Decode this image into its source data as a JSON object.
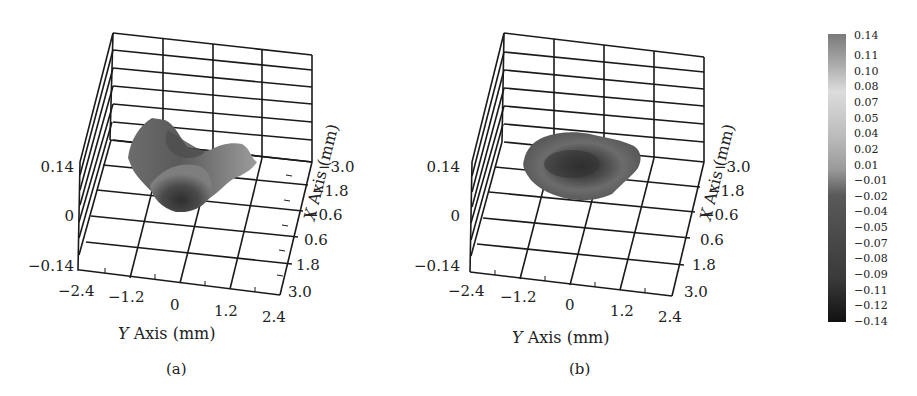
{
  "chart_data": [
    {
      "type": "surface3d",
      "panel_label": "(a)",
      "title": "",
      "xlabel": "Y Axis (mm)",
      "ylabel": "X Axis (mm)",
      "zlabel": "",
      "y_axis_ticks": [
        "-2.4",
        "-1.2",
        "0",
        "1.2",
        "2.4"
      ],
      "x_axis_ticks": [
        "-3.0",
        "-1.8",
        "-0.6",
        "0.6",
        "1.8",
        "3.0"
      ],
      "z_axis_ticks": [
        "0.14",
        "0",
        "-0.14"
      ],
      "ylim": [
        -2.4,
        2.4
      ],
      "xlim": [
        -3.0,
        3.0
      ],
      "zlim": [
        -0.14,
        0.14
      ],
      "grid": true,
      "description": "Irregular, asymmetric surface patch with a dark depressed central region and lighter raised lobes extending to the left and right; gray-scale colormap."
    },
    {
      "type": "surface3d",
      "panel_label": "(b)",
      "title": "",
      "xlabel": "Y Axis (mm)",
      "ylabel": "X Axis (mm)",
      "zlabel": "",
      "y_axis_ticks": [
        "-2.4",
        "-1.2",
        "0",
        "1.2",
        "2.4"
      ],
      "x_axis_ticks": [
        "-3.0",
        "-1.8",
        "-0.6",
        "0.6",
        "1.8",
        "3.0"
      ],
      "z_axis_ticks": [
        "0.14",
        "0",
        "-0.14"
      ],
      "ylim": [
        -2.4,
        2.4
      ],
      "xlim": [
        -3.0,
        3.0
      ],
      "zlim": [
        -0.14,
        0.14
      ],
      "grid": true,
      "description": "Roughly circular, ring-shaped surface patch with a darker central dip surrounded by a medium-gray rim; gray-scale colormap."
    },
    {
      "type": "colorbar",
      "labels": [
        "0.14",
        "0.11",
        "0.10",
        "0.08",
        "0.07",
        "0.05",
        "0.04",
        "0.02",
        "0.01",
        "-0.01",
        "-0.02",
        "-0.04",
        "-0.05",
        "-0.07",
        "-0.08",
        "-0.09",
        "-0.11",
        "-0.12",
        "-0.14"
      ],
      "range": [
        -0.14,
        0.14
      ],
      "colormap": "grayscale"
    }
  ],
  "panels": [
    {
      "caption": "(a)",
      "z_ticks": [
        "0.14",
        "0",
        "−0.14"
      ],
      "y_ticks": [
        "−2.4",
        "−1.2",
        "0",
        "1.2",
        "2.4"
      ],
      "x_ticks": [
        "−3.0",
        "−1.8",
        "−0.6",
        "0.6",
        "1.8",
        "3.0"
      ],
      "y_axis_letter": "Y",
      "y_axis_rest": " Axis (mm)",
      "x_axis_letter": "X",
      "x_axis_rest": " Axis (mm)"
    },
    {
      "caption": "(b)",
      "z_ticks": [
        "0.14",
        "0",
        "−0.14"
      ],
      "y_ticks": [
        "−2.4",
        "−1.2",
        "0",
        "1.2",
        "2.4"
      ],
      "x_ticks": [
        "−3.0",
        "−1.8",
        "−0.6",
        "0.6",
        "1.8",
        "3.0"
      ],
      "y_axis_letter": "Y",
      "y_axis_rest": " Axis (mm)",
      "x_axis_letter": "X",
      "x_axis_rest": " Axis (mm)"
    }
  ],
  "colorbar": {
    "labels": [
      "0.14",
      "0.11",
      "0.10",
      "0.08",
      "0.07",
      "0.05",
      "0.04",
      "0.02",
      "0.01",
      "−0.01",
      "−0.02",
      "−0.04",
      "−0.05",
      "−0.07",
      "−0.08",
      "−0.09",
      "−0.11",
      "−0.12",
      "−0.14"
    ],
    "colors": {
      "top": "#7a7a7a",
      "light": "#dcdcdc",
      "mid": "#9a9a9a",
      "dark": "#444444",
      "bottom": "#111111"
    }
  }
}
